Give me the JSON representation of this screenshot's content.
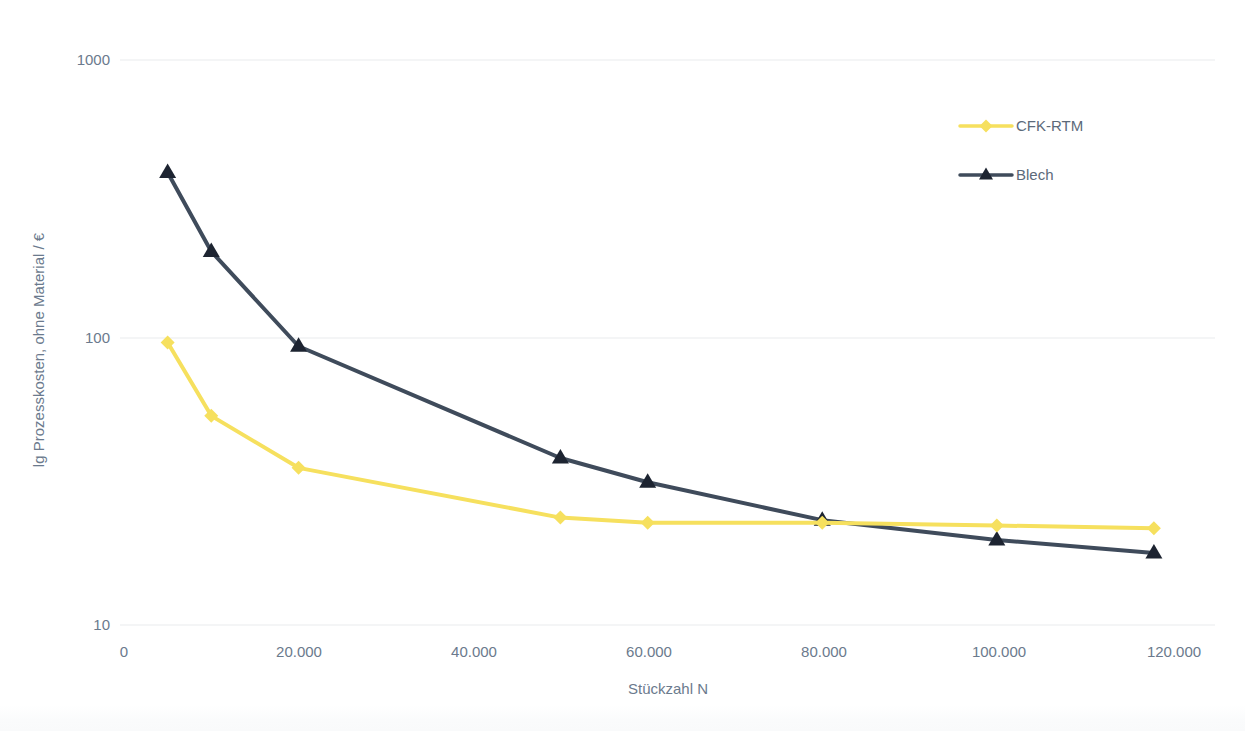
{
  "chart_data": {
    "type": "line",
    "title": "",
    "xlabel": "Stückzahl N",
    "ylabel": "lg Prozesskosten, ohne Material / €",
    "yscale": "log",
    "ylim": [
      10,
      1000
    ],
    "xlim": [
      0,
      125000
    ],
    "grid": true,
    "legend_position": "top-right",
    "y_ticks": [
      "10",
      "100",
      "1000"
    ],
    "y_tick_values": [
      10,
      100,
      1000
    ],
    "x_ticks": [
      "0",
      "20.000",
      "40.000",
      "60.000",
      "80.000",
      "100.000",
      "120.000"
    ],
    "x_tick_values": [
      0,
      20000,
      40000,
      60000,
      80000,
      100000,
      120000
    ],
    "series": [
      {
        "name": "CFK-RTM",
        "color": "#f6e05e",
        "marker": "diamond",
        "x": [
          5000,
          10000,
          20000,
          50000,
          60000,
          80000,
          100000,
          118000
        ],
        "values": [
          100,
          55,
          36,
          24,
          23,
          23,
          22.5,
          22
        ]
      },
      {
        "name": "Blech",
        "color": "#3f4b5b",
        "marker": "triangle",
        "x": [
          5000,
          10000,
          20000,
          50000,
          60000,
          80000,
          100000,
          118000
        ],
        "values": [
          400,
          210,
          97,
          39,
          32,
          23.5,
          20,
          18
        ]
      }
    ]
  },
  "legend": {
    "items": [
      {
        "label": "CFK-RTM",
        "color": "#f6e05e",
        "marker": "diamond"
      },
      {
        "label": "Blech",
        "color": "#3f4b5b",
        "marker": "triangle"
      }
    ]
  },
  "axes": {
    "y_title": "lg Prozesskosten, ohne Material / €",
    "x_title": "Stückzahl N",
    "y_tick_0": "10",
    "y_tick_1": "100",
    "y_tick_2": "1000",
    "x_tick_0": "0",
    "x_tick_1": "20.000",
    "x_tick_2": "40.000",
    "x_tick_3": "60.000",
    "x_tick_4": "80.000",
    "x_tick_5": "100.000",
    "x_tick_6": "120.000"
  },
  "colors": {
    "cfk": "#f6e05e",
    "blech": "#3f4b5b",
    "grid": "#e9eced",
    "text": "#6b7a8d",
    "background": "#ffffff"
  }
}
